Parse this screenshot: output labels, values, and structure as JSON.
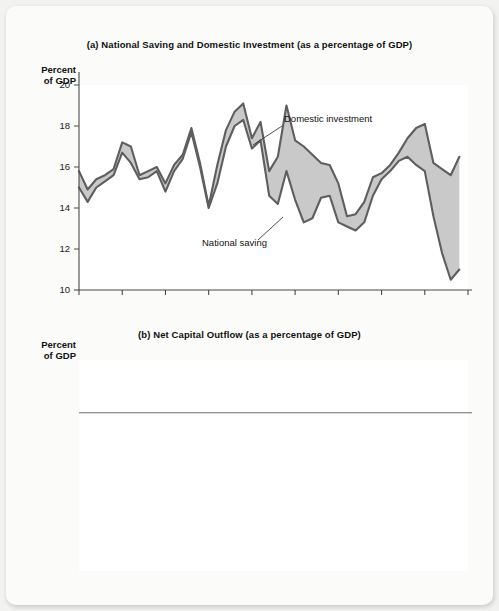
{
  "page": {
    "background_color": "#fbfbfa",
    "accent_fill": "#c9c9c9",
    "line_color": "#5e5e5e"
  },
  "panel_a": {
    "title": "(a) National Saving and Domestic Investment (as a percentage of GDP)",
    "axis_caption": "Percent\nof GDP",
    "annotations": [
      {
        "name": "domestic-investment",
        "label": "Domestic investment"
      },
      {
        "name": "national-saving",
        "label": "National saving"
      }
    ]
  },
  "panel_b": {
    "title": "(b) Net Capital Outflow (as a percentage of GDP)",
    "axis_caption": "Percent\nof GDP",
    "annotations": [
      {
        "name": "net-capital-outflow",
        "label": "Net capital\noutflow",
        "line1": "Net capital",
        "line2": "outflow"
      }
    ]
  },
  "chart_data": [
    {
      "type": "area",
      "id": "national-saving-and-domestic-investment",
      "title": "(a) National Saving and Domestic Investment (as a percentage of GDP)",
      "xlabel": "",
      "ylabel": "Percent of GDP",
      "xlim": [
        1960,
        2005
      ],
      "ylim": [
        10,
        20
      ],
      "yticks": [
        10,
        12,
        14,
        16,
        18,
        20
      ],
      "ytick_labels": [
        "10",
        "12",
        "14",
        "16",
        "18",
        "20"
      ],
      "xticks": [
        1960,
        1965,
        1970,
        1975,
        1980,
        1985,
        1990,
        1995,
        2000,
        2005
      ],
      "xtick_labels": [
        "1960",
        "1965",
        "1970",
        "1975",
        "1980",
        "1985",
        "1990",
        "1995",
        "2000",
        "2005"
      ],
      "grid": false,
      "legend": "annotated-inline",
      "fill_between": [
        "Domestic investment",
        "National saving"
      ],
      "fill_color": "#c9c9c9",
      "x": [
        1960,
        1961,
        1962,
        1963,
        1964,
        1965,
        1966,
        1967,
        1968,
        1969,
        1970,
        1971,
        1972,
        1973,
        1974,
        1975,
        1976,
        1977,
        1978,
        1979,
        1980,
        1981,
        1982,
        1983,
        1984,
        1985,
        1986,
        1987,
        1988,
        1989,
        1990,
        1991,
        1992,
        1993,
        1994,
        1995,
        1996,
        1997,
        1998,
        1999,
        2000,
        2001,
        2002,
        2003,
        2004
      ],
      "series": [
        {
          "name": "Domestic investment",
          "values": [
            15.8,
            14.9,
            15.4,
            15.6,
            15.9,
            17.2,
            17.0,
            15.6,
            15.8,
            16.0,
            15.2,
            16.1,
            16.6,
            17.9,
            16.2,
            14.1,
            16.1,
            17.8,
            18.7,
            19.1,
            17.4,
            18.2,
            15.8,
            16.5,
            19.0,
            17.3,
            17.0,
            16.6,
            16.2,
            16.1,
            15.2,
            13.6,
            13.7,
            14.3,
            15.5,
            15.7,
            16.1,
            16.7,
            17.4,
            17.9,
            18.1,
            16.2,
            15.9,
            15.6,
            16.5
          ]
        },
        {
          "name": "National saving",
          "values": [
            15.0,
            14.3,
            15.0,
            15.3,
            15.6,
            16.7,
            16.2,
            15.4,
            15.5,
            15.8,
            14.8,
            15.8,
            16.4,
            17.7,
            16.0,
            14.0,
            15.2,
            17.0,
            18.0,
            18.3,
            16.9,
            17.3,
            14.6,
            14.2,
            15.8,
            14.4,
            13.3,
            13.5,
            14.5,
            14.6,
            13.3,
            13.1,
            12.9,
            13.3,
            14.6,
            15.4,
            15.8,
            16.3,
            16.5,
            16.1,
            15.8,
            13.6,
            11.8,
            10.5,
            11.0
          ]
        }
      ]
    },
    {
      "type": "line",
      "id": "net-capital-outflow",
      "title": "(b) Net Capital Outflow (as a percentage of GDP)",
      "xlabel": "",
      "ylabel": "Percent of GDP",
      "xlim": [
        1960,
        2005
      ],
      "ylim": [
        -6,
        2
      ],
      "yticks": [
        -6,
        -5,
        -4,
        -3,
        -2,
        -1,
        0,
        1,
        2
      ],
      "ytick_labels": [
        "−6",
        "−5",
        "−4",
        "−3",
        "−2",
        "−1",
        "0",
        "1",
        "2"
      ],
      "xticks": [
        1960,
        1965,
        1970,
        1975,
        1980,
        1985,
        1990,
        1995,
        2000,
        2005
      ],
      "xtick_labels": [
        "1960",
        "1965",
        "1970",
        "1975",
        "1980",
        "1985",
        "1990",
        "1995",
        "2000",
        "2005"
      ],
      "grid": false,
      "zero_line": 0,
      "series": [
        {
          "name": "Net capital outflow",
          "values": [
            0.75,
            0.9,
            0.85,
            0.7,
            0.8,
            1.25,
            0.75,
            0.55,
            0.4,
            0.35,
            0.3,
            0.1,
            0.1,
            0.3,
            0.2,
            -0.35,
            0.2,
            -0.15,
            0.9,
            0.55,
            0.1,
            -0.45,
            -1.15,
            -1.2,
            -1.15,
            -1.0,
            -1.45,
            -1.6,
            -1.2,
            -0.95,
            -0.75,
            -0.3,
            -0.45,
            -0.55,
            -0.65,
            -0.6,
            -0.7,
            -0.7,
            -1.1,
            -1.7,
            -2.4,
            -2.2,
            -2.6,
            -3.1,
            -3.6
          ]
        }
      ]
    }
  ]
}
